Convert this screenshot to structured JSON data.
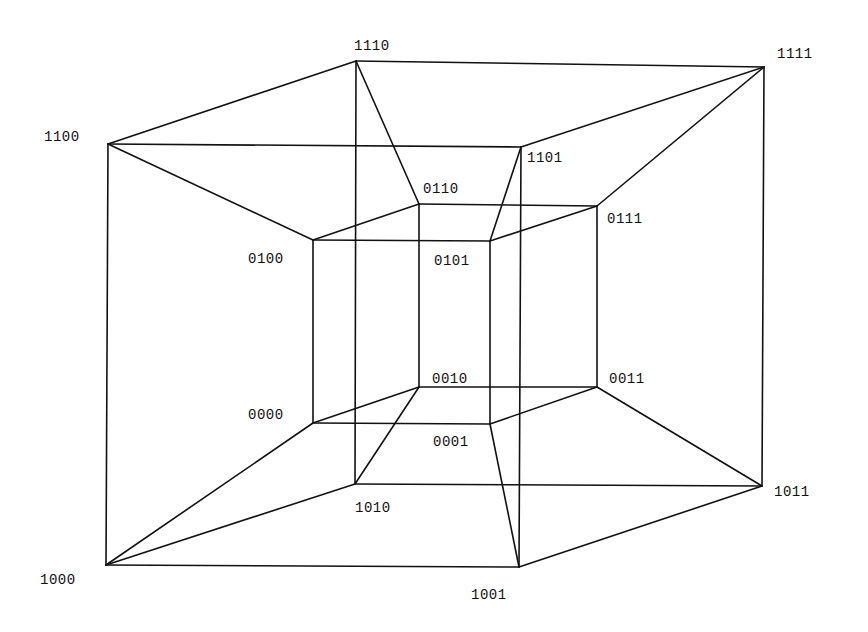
{
  "diagram": {
    "type": "tesseract-projection",
    "vertices": [
      {
        "id": "0000",
        "x": 313,
        "y": 423,
        "label_x": 248,
        "label_y": 419
      },
      {
        "id": "0001",
        "x": 490,
        "y": 424,
        "label_x": 433,
        "label_y": 446
      },
      {
        "id": "0010",
        "x": 419,
        "y": 387,
        "label_x": 432,
        "label_y": 383
      },
      {
        "id": "0011",
        "x": 597,
        "y": 387,
        "label_x": 609,
        "label_y": 383
      },
      {
        "id": "0100",
        "x": 313,
        "y": 240,
        "label_x": 248,
        "label_y": 263
      },
      {
        "id": "0101",
        "x": 490,
        "y": 241,
        "label_x": 434,
        "label_y": 265
      },
      {
        "id": "0110",
        "x": 419,
        "y": 204,
        "label_x": 423,
        "label_y": 193
      },
      {
        "id": "0111",
        "x": 597,
        "y": 206,
        "label_x": 607,
        "label_y": 223
      },
      {
        "id": "1000",
        "x": 106,
        "y": 565,
        "label_x": 40,
        "label_y": 584
      },
      {
        "id": "1001",
        "x": 519,
        "y": 567,
        "label_x": 471,
        "label_y": 599
      },
      {
        "id": "1010",
        "x": 355,
        "y": 484,
        "label_x": 355,
        "label_y": 512
      },
      {
        "id": "1011",
        "x": 762,
        "y": 486,
        "label_x": 774,
        "label_y": 496
      },
      {
        "id": "1100",
        "x": 108,
        "y": 144,
        "label_x": 44,
        "label_y": 141
      },
      {
        "id": "1101",
        "x": 521,
        "y": 147,
        "label_x": 527,
        "label_y": 162
      },
      {
        "id": "1110",
        "x": 356,
        "y": 61,
        "label_x": 354,
        "label_y": 50
      },
      {
        "id": "1111",
        "x": 764,
        "y": 67,
        "label_x": 777,
        "label_y": 58
      }
    ],
    "edges": [
      [
        "0000",
        "0001"
      ],
      [
        "0000",
        "0010"
      ],
      [
        "0000",
        "0100"
      ],
      [
        "0001",
        "0011"
      ],
      [
        "0001",
        "0101"
      ],
      [
        "0010",
        "0011"
      ],
      [
        "0010",
        "0110"
      ],
      [
        "0011",
        "0111"
      ],
      [
        "0100",
        "0101"
      ],
      [
        "0100",
        "0110"
      ],
      [
        "0101",
        "0111"
      ],
      [
        "0110",
        "0111"
      ],
      [
        "1000",
        "1001"
      ],
      [
        "1000",
        "1010"
      ],
      [
        "1000",
        "1100"
      ],
      [
        "1001",
        "1011"
      ],
      [
        "1001",
        "1101"
      ],
      [
        "1010",
        "1011"
      ],
      [
        "1010",
        "1110"
      ],
      [
        "1011",
        "1111"
      ],
      [
        "1100",
        "1101"
      ],
      [
        "1100",
        "1110"
      ],
      [
        "1101",
        "1111"
      ],
      [
        "1110",
        "1111"
      ],
      [
        "0000",
        "1000"
      ],
      [
        "0001",
        "1001"
      ],
      [
        "0010",
        "1010"
      ],
      [
        "0011",
        "1011"
      ],
      [
        "0100",
        "1100"
      ],
      [
        "0101",
        "1101"
      ],
      [
        "0110",
        "1110"
      ],
      [
        "0111",
        "1111"
      ]
    ],
    "colors": {
      "background": "#ffffff",
      "line": "#111111",
      "text": "#111111"
    }
  }
}
